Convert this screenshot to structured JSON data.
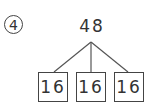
{
  "problem": {
    "number": "4",
    "total": "48",
    "parts": [
      "16",
      "16",
      "16"
    ]
  }
}
